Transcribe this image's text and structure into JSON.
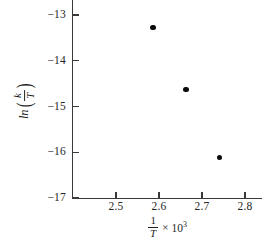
{
  "chart_data": {
    "type": "scatter",
    "title": "",
    "xlabel": "1/T × 10³",
    "ylabel": "ln(k/T)",
    "xlabel_parts": {
      "numerator": "1",
      "denominator": "T",
      "times": "×",
      "factor_base": "10",
      "factor_exponent": "3"
    },
    "ylabel_parts": {
      "function": "ln",
      "open_paren": "(",
      "numerator": "k",
      "denominator": "T",
      "close_paren": ")"
    },
    "x": [
      2.586,
      2.663,
      2.74
    ],
    "y": [
      -13.28,
      -14.63,
      -16.11
    ],
    "points": [
      {
        "x": 2.586,
        "y": -13.28
      },
      {
        "x": 2.663,
        "y": -14.63
      },
      {
        "x": 2.74,
        "y": -16.11
      }
    ],
    "xticks": [
      2.5,
      2.6,
      2.7,
      2.8
    ],
    "xtick_labels": [
      "2.5",
      "2.6",
      "2.7",
      "2.8"
    ],
    "yticks": [
      -13,
      -14,
      -15,
      -16,
      -17
    ],
    "ytick_labels": [
      "−13",
      "−14",
      "−15",
      "−16",
      "−17"
    ],
    "xlim": [
      2.448,
      2.889
    ],
    "ylim": [
      -17.0,
      -12.674
    ],
    "grid": false,
    "legend": null,
    "marker": "filled-circle",
    "marker_color": "#0b0b0b",
    "axis_color": "#3a3a3a",
    "background": "#ffffff"
  }
}
